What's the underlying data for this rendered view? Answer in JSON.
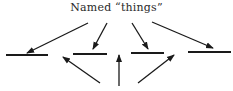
{
  "diagram": {
    "title": "Named “things”",
    "stroke_color": "#1a1a1a",
    "lines": [
      {
        "x1": 6,
        "y1": 55,
        "x2": 48,
        "y2": 55
      },
      {
        "x1": 73,
        "y1": 54,
        "x2": 107,
        "y2": 54
      },
      {
        "x1": 131,
        "y1": 53,
        "x2": 164,
        "y2": 53
      },
      {
        "x1": 188,
        "y1": 52,
        "x2": 231,
        "y2": 52
      }
    ],
    "top_arrows": [
      {
        "x1": 88,
        "y1": 23,
        "x2": 27,
        "y2": 53
      },
      {
        "x1": 107,
        "y1": 23,
        "x2": 93,
        "y2": 49
      },
      {
        "x1": 132,
        "y1": 23,
        "x2": 148,
        "y2": 49
      },
      {
        "x1": 152,
        "y1": 22,
        "x2": 213,
        "y2": 48
      }
    ],
    "bottom_arrows": [
      {
        "x1": 100,
        "y1": 83,
        "x2": 63,
        "y2": 57
      },
      {
        "x1": 119,
        "y1": 86,
        "x2": 119,
        "y2": 55
      },
      {
        "x1": 138,
        "y1": 83,
        "x2": 174,
        "y2": 55
      }
    ]
  }
}
